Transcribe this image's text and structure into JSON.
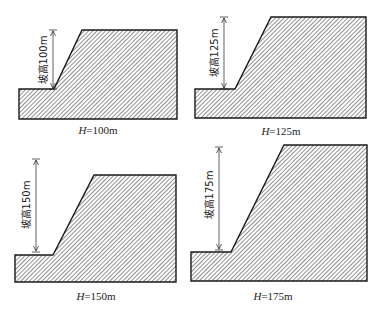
{
  "figure": {
    "panels": [
      {
        "id": "h100",
        "height_label": "坡高100m",
        "caption_var": "H",
        "caption_value": "=100m",
        "caption": "H=100m",
        "shape": "19,89 54,89 82,30 177,30 177,119 19,119",
        "arrow": {
          "x": 53,
          "y1": 30,
          "y2": 89
        },
        "label_pos": {
          "x": 44,
          "y": 60
        },
        "caption_pos": {
          "x": 98,
          "y": 134
        }
      },
      {
        "id": "h125",
        "height_label": "坡高125m",
        "caption_var": "H",
        "caption_value": "=125m",
        "caption": "H=125m",
        "shape": "195,89 235,89 271,17 366,17 366,118 195,118",
        "arrow": {
          "x": 224,
          "y1": 17,
          "y2": 89
        },
        "label_pos": {
          "x": 215,
          "y": 53
        },
        "caption_pos": {
          "x": 281,
          "y": 135
        }
      },
      {
        "id": "h150",
        "height_label": "坡高150m",
        "caption_var": "H",
        "caption_value": "=150m",
        "caption": "H=150m",
        "shape": "15,255 53,255 94,175 176,175 176,282 15,282",
        "arrow": {
          "x": 36,
          "y1": 159,
          "y2": 252
        },
        "label_pos": {
          "x": 27,
          "y": 205
        },
        "caption_pos": {
          "x": 96,
          "y": 300
        }
      },
      {
        "id": "h175",
        "height_label": "坡高175m",
        "caption_var": "H",
        "caption_value": "=175m",
        "caption": "H=175m",
        "shape": "191,252 231,252 284,145 367,145 367,281 191,281",
        "arrow": {
          "x": 219,
          "y1": 147,
          "y2": 250
        },
        "label_pos": {
          "x": 210,
          "y": 195
        },
        "caption_pos": {
          "x": 273,
          "y": 300
        }
      }
    ],
    "colors": {
      "outline": "#1a1a1a",
      "hatch": "#555555",
      "fill": "#ffffff",
      "text": "#222222"
    }
  }
}
